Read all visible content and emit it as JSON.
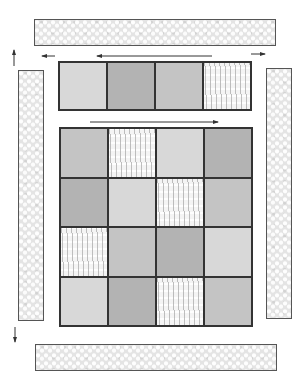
{
  "diagram": {
    "title": "",
    "colors": {
      "outline": "#333333",
      "light_fabric": "#d8d8d8",
      "medium_fabric": "#c4c4c4",
      "dark_fabric": "#b3b3b3",
      "patterned_fabric": "#f4f4f4",
      "border_fabric": "#e4e4e4",
      "arrow": "#333333"
    },
    "top_row": [
      "light",
      "dark",
      "mid",
      "pattern"
    ],
    "grid": [
      [
        "mid",
        "pattern",
        "light",
        "dark"
      ],
      [
        "dark",
        "light",
        "pattern",
        "mid"
      ],
      [
        "pattern",
        "mid",
        "dark",
        "light"
      ],
      [
        "light",
        "dark",
        "pattern",
        "mid"
      ]
    ],
    "borders": {
      "top": "horizontal border strip",
      "bottom": "horizontal border strip",
      "left": "vertical border strip",
      "right": "vertical border strip"
    },
    "arrows": [
      {
        "id": "top-row-left-short",
        "direction": "left"
      },
      {
        "id": "top-row-left-long",
        "direction": "left"
      },
      {
        "id": "top-row-right-short",
        "direction": "right"
      },
      {
        "id": "grid-top-right-long",
        "direction": "right"
      },
      {
        "id": "left-strip-up",
        "direction": "up"
      },
      {
        "id": "left-strip-down",
        "direction": "down"
      }
    ]
  }
}
